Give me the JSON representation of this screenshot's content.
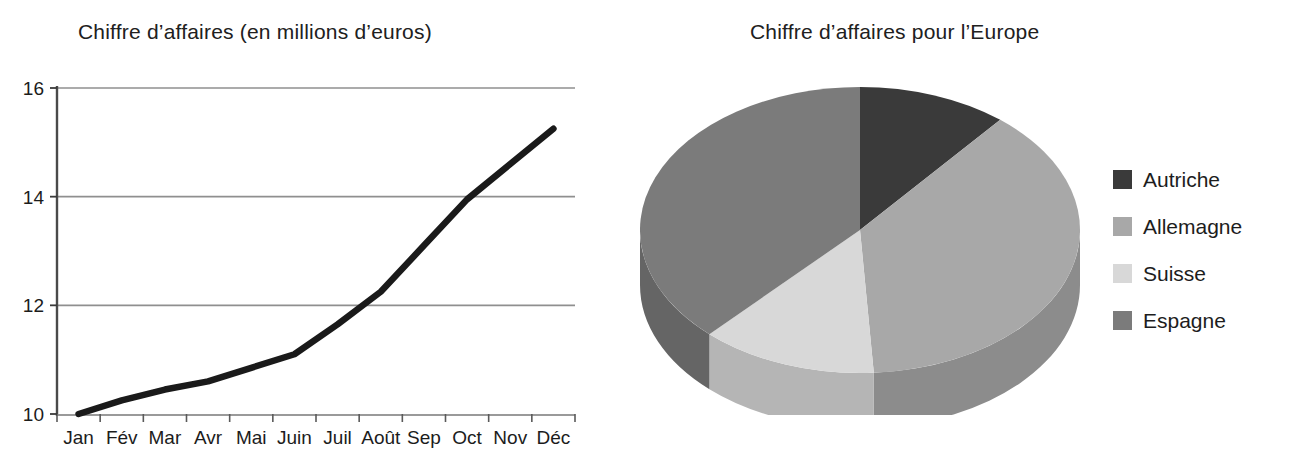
{
  "chart_data": [
    {
      "type": "line",
      "title": "Chiffre d’affaires (en millions d’euros)",
      "xlabel": "",
      "ylabel": "",
      "categories": [
        "Jan",
        "Fév",
        "Mar",
        "Avr",
        "Mai",
        "Juin",
        "Juil",
        "Août",
        "Sep",
        "Oct",
        "Nov",
        "Déc"
      ],
      "values": [
        10.0,
        10.25,
        10.45,
        10.6,
        10.85,
        11.1,
        11.65,
        12.25,
        13.1,
        13.95,
        14.6,
        15.25
      ],
      "series": [
        {
          "name": "Chiffre d’affaires",
          "values": [
            10.0,
            10.25,
            10.45,
            10.6,
            10.85,
            11.1,
            11.65,
            12.25,
            13.1,
            13.95,
            14.6,
            15.25
          ]
        }
      ],
      "ylim": [
        10,
        16
      ],
      "yticks": [
        "10",
        "12",
        "14",
        "16"
      ],
      "ytick_values": [
        10,
        12,
        14,
        16
      ],
      "grid": "horizontal",
      "legend": "none",
      "line_color": "#1a1a1a",
      "grid_color": "#8f8f8f"
    },
    {
      "type": "pie",
      "title": "Chiffre d’affaires pour l’Europe",
      "labels": [
        "Autriche",
        "Allemagne",
        "Suisse",
        "Espagne"
      ],
      "values": [
        11,
        38,
        13,
        38
      ],
      "colors": [
        "#3a3a3a",
        "#a8a8a8",
        "#d8d8d8",
        "#7b7b7b"
      ],
      "side_colors": [
        "#2e2e2e",
        "#8c8c8c",
        "#b5b5b5",
        "#656565"
      ],
      "legend": "right",
      "style": "3d",
      "start_angle_deg": 0,
      "direction": "clockwise"
    }
  ],
  "line_chart": {
    "title": "Chiffre d’affaires (en millions d’euros)",
    "y_ticks": [
      "10",
      "12",
      "14",
      "16"
    ],
    "x_ticks": [
      "Jan",
      "Fév",
      "Mar",
      "Avr",
      "Mai",
      "Juin",
      "Juil",
      "Août",
      "Sep",
      "Oct",
      "Nov",
      "Déc"
    ]
  },
  "pie_chart": {
    "title": "Chiffre d’affaires pour l’Europe",
    "legend": [
      {
        "label": "Autriche",
        "color": "#3a3a3a"
      },
      {
        "label": "Allemagne",
        "color": "#a8a8a8"
      },
      {
        "label": "Suisse",
        "color": "#d8d8d8"
      },
      {
        "label": "Espagne",
        "color": "#7b7b7b"
      }
    ]
  }
}
